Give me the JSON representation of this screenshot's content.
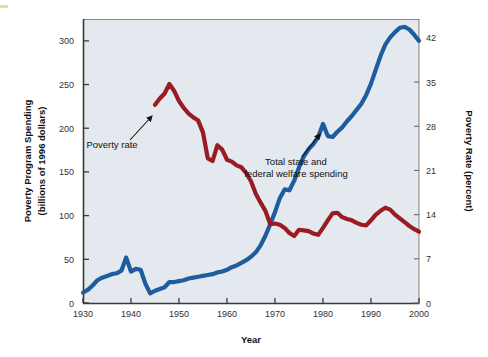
{
  "chart_data": {
    "type": "line",
    "title": "",
    "xlabel": "Year",
    "ylabel": "Poverty Program Spending (billions of 1996 dollars)",
    "ylabel_line1": "Poverty Program Spending",
    "ylabel_line2": "(billions of 1996 dollars)",
    "y2label": "Poverty Rate (percent)",
    "xlim": [
      1930,
      2000
    ],
    "ylim": [
      0,
      325
    ],
    "y2lim": [
      0,
      45
    ],
    "grid": false,
    "legend_position": "inline-annotations",
    "xticks": [
      "1930",
      "1940",
      "1950",
      "1960",
      "1970",
      "1980",
      "1990",
      "2000"
    ],
    "xtick_values": [
      1930,
      1940,
      1950,
      1960,
      1970,
      1980,
      1990,
      2000
    ],
    "yticks": [
      "0",
      "50",
      "100",
      "150",
      "200",
      "250",
      "300"
    ],
    "ytick_values": [
      0,
      50,
      100,
      150,
      200,
      250,
      300
    ],
    "y2ticks": [
      "0",
      "7",
      "14",
      "21",
      "28",
      "35",
      "42"
    ],
    "y2tick_values": [
      0,
      7,
      14,
      21,
      28,
      35,
      42
    ],
    "plot_bg_color": "#e4e8ef",
    "series": [
      {
        "name": "Total state and federal welfare spending",
        "axis": "left",
        "color": "#1f5c9e",
        "units": "billions of 1996 dollars",
        "points": [
          [
            1930,
            12
          ],
          [
            1931,
            15
          ],
          [
            1932,
            20
          ],
          [
            1933,
            26
          ],
          [
            1934,
            29
          ],
          [
            1935,
            31
          ],
          [
            1936,
            33
          ],
          [
            1937,
            34
          ],
          [
            1938,
            37
          ],
          [
            1939,
            52
          ],
          [
            1940,
            36
          ],
          [
            1941,
            39
          ],
          [
            1942,
            38
          ],
          [
            1943,
            22
          ],
          [
            1944,
            11
          ],
          [
            1945,
            14
          ],
          [
            1946,
            16
          ],
          [
            1947,
            18
          ],
          [
            1948,
            24
          ],
          [
            1949,
            24
          ],
          [
            1950,
            25
          ],
          [
            1951,
            26
          ],
          [
            1952,
            28
          ],
          [
            1953,
            29
          ],
          [
            1954,
            30
          ],
          [
            1955,
            31
          ],
          [
            1956,
            32
          ],
          [
            1957,
            33
          ],
          [
            1958,
            35
          ],
          [
            1959,
            36
          ],
          [
            1960,
            38
          ],
          [
            1961,
            41
          ],
          [
            1962,
            43
          ],
          [
            1963,
            46
          ],
          [
            1964,
            49
          ],
          [
            1965,
            53
          ],
          [
            1966,
            58
          ],
          [
            1967,
            66
          ],
          [
            1968,
            77
          ],
          [
            1969,
            90
          ],
          [
            1970,
            104
          ],
          [
            1971,
            120
          ],
          [
            1972,
            130
          ],
          [
            1973,
            129
          ],
          [
            1974,
            140
          ],
          [
            1975,
            155
          ],
          [
            1976,
            168
          ],
          [
            1977,
            176
          ],
          [
            1978,
            182
          ],
          [
            1979,
            190
          ],
          [
            1980,
            205
          ],
          [
            1981,
            191
          ],
          [
            1982,
            190
          ],
          [
            1983,
            196
          ],
          [
            1984,
            201
          ],
          [
            1985,
            208
          ],
          [
            1986,
            214
          ],
          [
            1987,
            221
          ],
          [
            1988,
            228
          ],
          [
            1989,
            238
          ],
          [
            1990,
            251
          ],
          [
            1991,
            267
          ],
          [
            1992,
            283
          ],
          [
            1993,
            296
          ],
          [
            1994,
            304
          ],
          [
            1995,
            310
          ],
          [
            1996,
            315
          ],
          [
            1997,
            316
          ],
          [
            1998,
            313
          ],
          [
            1999,
            307
          ],
          [
            2000,
            300
          ]
        ]
      },
      {
        "name": "Poverty rate",
        "axis": "right",
        "color": "#9b1b22",
        "units": "percent",
        "points": [
          [
            1945,
            31.4
          ],
          [
            1946,
            32.4
          ],
          [
            1947,
            33.2
          ],
          [
            1948,
            34.7
          ],
          [
            1949,
            33.6
          ],
          [
            1950,
            32.0
          ],
          [
            1951,
            30.9
          ],
          [
            1952,
            30.0
          ],
          [
            1953,
            29.4
          ],
          [
            1954,
            28.9
          ],
          [
            1955,
            27.0
          ],
          [
            1956,
            22.9
          ],
          [
            1957,
            22.5
          ],
          [
            1958,
            25.0
          ],
          [
            1959,
            24.3
          ],
          [
            1960,
            22.7
          ],
          [
            1961,
            22.4
          ],
          [
            1962,
            21.8
          ],
          [
            1963,
            21.5
          ],
          [
            1964,
            20.6
          ],
          [
            1965,
            19.3
          ],
          [
            1966,
            17.3
          ],
          [
            1967,
            15.9
          ],
          [
            1968,
            14.6
          ],
          [
            1969,
            12.5
          ],
          [
            1970,
            12.6
          ],
          [
            1971,
            12.4
          ],
          [
            1972,
            11.9
          ],
          [
            1973,
            11.1
          ],
          [
            1974,
            10.6
          ],
          [
            1975,
            11.6
          ],
          [
            1976,
            11.5
          ],
          [
            1977,
            11.4
          ],
          [
            1978,
            11.0
          ],
          [
            1979,
            10.8
          ],
          [
            1980,
            11.9
          ],
          [
            1981,
            13.1
          ],
          [
            1982,
            14.2
          ],
          [
            1983,
            14.3
          ],
          [
            1984,
            13.6
          ],
          [
            1985,
            13.3
          ],
          [
            1986,
            13.1
          ],
          [
            1987,
            12.7
          ],
          [
            1988,
            12.4
          ],
          [
            1989,
            12.3
          ],
          [
            1990,
            13.1
          ],
          [
            1991,
            14.0
          ],
          [
            1992,
            14.6
          ],
          [
            1993,
            15.1
          ],
          [
            1994,
            14.8
          ],
          [
            1995,
            14.0
          ],
          [
            1996,
            13.4
          ],
          [
            1997,
            12.8
          ],
          [
            1998,
            12.2
          ],
          [
            1999,
            11.7
          ],
          [
            2000,
            11.3
          ]
        ]
      }
    ],
    "annotations": [
      {
        "id": "poverty-rate",
        "text": "Poverty rate",
        "text_x": 112,
        "text_y": 148,
        "arrow_from_x": 130,
        "arrow_from_y": 140,
        "arrow_to_x": 152,
        "arrow_to_y": 116
      },
      {
        "id": "welfare-spending",
        "text_line1": "Total state and",
        "text_line2": "federal welfare spending",
        "text_x": 296,
        "text_y": 165,
        "arrow_from_x": 302,
        "arrow_from_y": 157,
        "arrow_to_x": 320,
        "arrow_to_y": 134
      }
    ]
  }
}
